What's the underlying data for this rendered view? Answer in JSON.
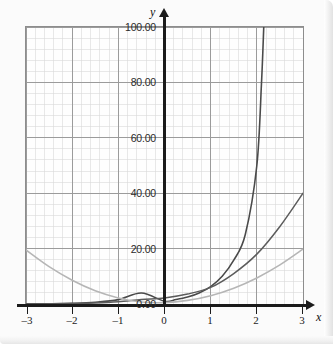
{
  "figure": {
    "background_color": "#fbfbfb",
    "plot_background_color": "#fefefe",
    "plot_border_color": "#8d8d8d",
    "axis_color": "#1b1b1b",
    "grid_major_color": "#9a9a9a",
    "grid_minor_color": "#d8d8d8"
  },
  "axes": {
    "x_name": "x",
    "y_name": "y",
    "x_ticks": [
      "–3",
      "–2",
      "–1",
      "0",
      "1",
      "2",
      "3"
    ],
    "y_ticks": [
      "0.00",
      "20.00",
      "40.00",
      "60.00",
      "80.00",
      "100.00"
    ],
    "origin_label": "0.00"
  },
  "chart_data": {
    "type": "line",
    "title": "",
    "xlabel": "x",
    "ylabel": "y",
    "xlim": [
      -3,
      3
    ],
    "ylim": [
      0,
      100
    ],
    "xticks": [
      -3,
      -2,
      -1,
      0,
      1,
      2,
      3
    ],
    "yticks": [
      0,
      20,
      40,
      60,
      80,
      100
    ],
    "xtick_labels": [
      "–3",
      "–2",
      "–1",
      "0",
      "1",
      "2",
      "3"
    ],
    "ytick_labels": [
      "0.00",
      "20.00",
      "40.00",
      "60.00",
      "80.00",
      "100.00"
    ],
    "grid": true,
    "grid_minor": true,
    "legend": "none",
    "series": [
      {
        "name": "steep-exponential",
        "color": "#4a4a4a",
        "width": 1.6,
        "x": [
          -3,
          -2.5,
          -2,
          -1.5,
          -1,
          -0.5,
          0,
          0.25,
          0.5,
          0.75,
          1,
          1.25,
          1.5,
          1.75,
          2,
          2.1,
          2.15
        ],
        "values": [
          0.04,
          0.1,
          0.25,
          0.63,
          1.58,
          3.95,
          1.0,
          1.6,
          2.5,
          4.0,
          6.3,
          10.0,
          15.8,
          25.1,
          50.0,
          79.4,
          100.0
        ]
      },
      {
        "name": "medium-exponential",
        "color": "#5c5c5c",
        "width": 1.5,
        "x": [
          -3,
          -2.5,
          -2,
          -1.5,
          -1,
          -0.5,
          0,
          0.5,
          1,
          1.5,
          2,
          2.5,
          3
        ],
        "values": [
          0.02,
          0.06,
          0.15,
          0.35,
          0.8,
          1.6,
          2.2,
          3.6,
          6.0,
          11.0,
          18.0,
          28.0,
          40.0
        ]
      },
      {
        "name": "light-parabola",
        "color": "#b6b6b6",
        "width": 1.6,
        "x": [
          -3,
          -2.5,
          -2,
          -1.5,
          -1,
          -0.5,
          0,
          0.5,
          1,
          1.5,
          2,
          2.5,
          3
        ],
        "values": [
          19.5,
          13.5,
          8.6,
          4.8,
          2.2,
          0.7,
          0.5,
          1.3,
          3.0,
          5.7,
          9.4,
          14.1,
          19.8
        ]
      }
    ]
  }
}
